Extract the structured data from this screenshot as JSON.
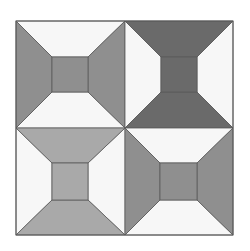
{
  "colors": {
    "background": "#ffffff",
    "white": "#f7f7f7",
    "light_gray": "#a9a9a9",
    "mid_gray": "#8f8f8f",
    "dark_gray": "#6a6a6a",
    "outline": "#5a5a5a"
  },
  "blocks": [
    {
      "position": "top-left",
      "sides": "mid_gray",
      "topbottom": "white",
      "center": "mid_gray"
    },
    {
      "position": "top-right",
      "sides": "white",
      "topbottom": "dark_gray",
      "center": "dark_gray"
    },
    {
      "position": "bottom-left",
      "sides": "white",
      "topbottom": "light_gray",
      "center": "light_gray"
    },
    {
      "position": "bottom-right",
      "sides": "mid_gray",
      "topbottom": "white",
      "center": "mid_gray"
    }
  ]
}
